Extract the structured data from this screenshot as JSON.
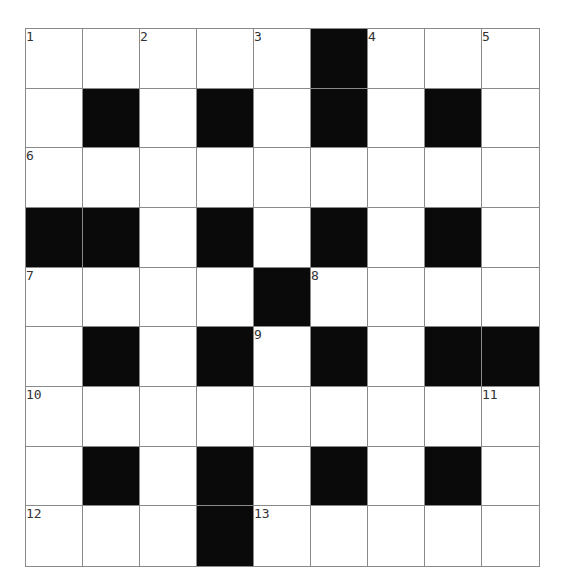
{
  "puzzle": {
    "rows": 9,
    "cols": 9,
    "cell_colors": {
      "black": "#0a0a0a",
      "white": "#ffffff",
      "gridline": "#8a8a8a"
    },
    "layout": [
      ".....#...",
      ".#.#.#.#.",
      ".........",
      "##.#.#.#.",
      "....#....",
      ".#.#.#.##",
      ".........",
      ".#.#.#.#.",
      "...#....."
    ],
    "numbers": [
      {
        "r": 0,
        "c": 0,
        "n": "1"
      },
      {
        "r": 0,
        "c": 2,
        "n": "2"
      },
      {
        "r": 0,
        "c": 4,
        "n": "3"
      },
      {
        "r": 0,
        "c": 6,
        "n": "4"
      },
      {
        "r": 0,
        "c": 8,
        "n": "5"
      },
      {
        "r": 2,
        "c": 0,
        "n": "6"
      },
      {
        "r": 4,
        "c": 0,
        "n": "7"
      },
      {
        "r": 4,
        "c": 5,
        "n": "8"
      },
      {
        "r": 5,
        "c": 4,
        "n": "9"
      },
      {
        "r": 6,
        "c": 0,
        "n": "10"
      },
      {
        "r": 6,
        "c": 8,
        "n": "11"
      },
      {
        "r": 8,
        "c": 0,
        "n": "12"
      },
      {
        "r": 8,
        "c": 4,
        "n": "13"
      }
    ]
  }
}
